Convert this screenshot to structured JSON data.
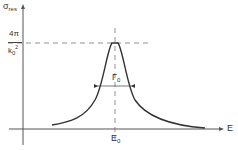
{
  "diagram": {
    "y_axis": {
      "symbol": "σ",
      "subscript": "res"
    },
    "x_axis": {
      "symbol": "E"
    },
    "peak_label": {
      "numerator": "4π",
      "denominator": "k",
      "den_sub": "0",
      "den_sup": "2"
    },
    "center_label": {
      "symbol": "E",
      "subscript": "0"
    },
    "width_label": {
      "symbol": "Γ",
      "subscript": "0"
    }
  },
  "colors": {
    "line": "#333333",
    "dash": "#666666",
    "background": "#ffffff"
  }
}
